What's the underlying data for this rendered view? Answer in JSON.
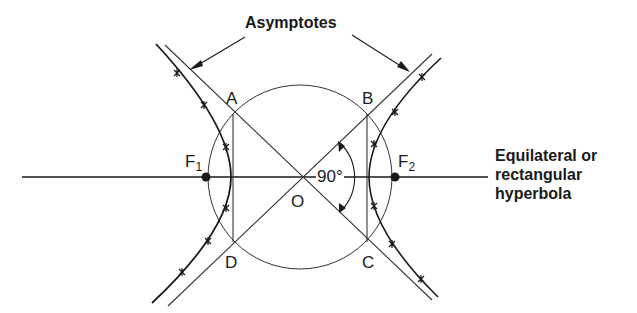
{
  "diagram": {
    "title_label": "Asymptotes",
    "caption": {
      "line1": "Equilateral or",
      "line2": "rectangular",
      "line3": "hyperbola"
    },
    "points": {
      "A": "A",
      "B": "B",
      "C": "C",
      "D": "D",
      "O": "O",
      "F1_main": "F",
      "F1_sub": "1",
      "F2_main": "F",
      "F2_sub": "2"
    },
    "angle_label": "90°",
    "colors": {
      "line": "#1a1a1a",
      "thin": "#333333"
    }
  }
}
